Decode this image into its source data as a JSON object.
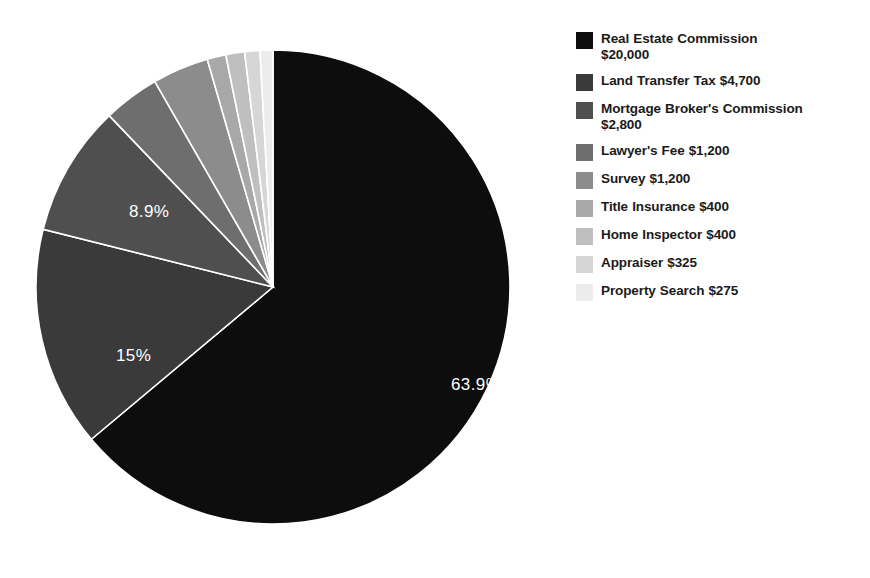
{
  "chart_data": {
    "type": "pie",
    "title": "",
    "subtitle": "",
    "xlabel": "",
    "ylabel": "",
    "grid": false,
    "legend_position": "right",
    "start_angle_deg": 0,
    "direction": "clockwise",
    "total": 31300,
    "currency": "$",
    "categories": [
      "Real Estate Commission",
      "Land Transfer Tax",
      "Mortgage Broker's Commission",
      "Lawyer's Fee",
      "Survey",
      "Title Insurance",
      "Home Inspector",
      "Appraiser",
      "Property Search"
    ],
    "values": [
      20000,
      4700,
      2800,
      1200,
      1200,
      400,
      400,
      325,
      275
    ],
    "percents": [
      63.9,
      15.0,
      8.9,
      3.8,
      3.8,
      1.3,
      1.3,
      1.0,
      0.9
    ],
    "colors": [
      "#0d0d0d",
      "#3a3a3a",
      "#4f4f4f",
      "#6e6e6e",
      "#8c8c8c",
      "#a8a8a8",
      "#bfbfbf",
      "#d6d6d6",
      "#ececec"
    ],
    "slice_label_format": "percent",
    "visible_slice_labels": [
      {
        "text": "63.9%",
        "x": 418,
        "y": 367
      },
      {
        "text": "15%",
        "x": 83,
        "y": 338
      },
      {
        "text": "8.9%",
        "x": 96,
        "y": 194
      }
    ]
  },
  "legend": {
    "items": [
      {
        "label": "Real Estate Commission $20,000",
        "color": "#0d0d0d",
        "swatch_name": "legend-swatch-real-estate-commission"
      },
      {
        "label": "Land Transfer Tax $4,700",
        "color": "#3a3a3a",
        "swatch_name": "legend-swatch-land-transfer-tax"
      },
      {
        "label": "Mortgage Broker's Commission $2,800",
        "color": "#4f4f4f",
        "swatch_name": "legend-swatch-mortgage-brokers-commission"
      },
      {
        "label": "Lawyer's Fee $1,200",
        "color": "#6e6e6e",
        "swatch_name": "legend-swatch-lawyers-fee"
      },
      {
        "label": "Survey $1,200",
        "color": "#8c8c8c",
        "swatch_name": "legend-swatch-survey"
      },
      {
        "label": "Title Insurance $400",
        "color": "#a8a8a8",
        "swatch_name": "legend-swatch-title-insurance"
      },
      {
        "label": "Home Inspector $400",
        "color": "#bfbfbf",
        "swatch_name": "legend-swatch-home-inspector"
      },
      {
        "label": "Appraiser $325",
        "color": "#d6d6d6",
        "swatch_name": "legend-swatch-appraiser"
      },
      {
        "label": "Property Search $275",
        "color": "#ececec",
        "swatch_name": "legend-swatch-property-search"
      }
    ]
  },
  "colors": {
    "background": "#ffffff",
    "slice_divider": "#ffffff",
    "slice_label_text": "#ffffff",
    "legend_text": "#1a1a1a"
  }
}
